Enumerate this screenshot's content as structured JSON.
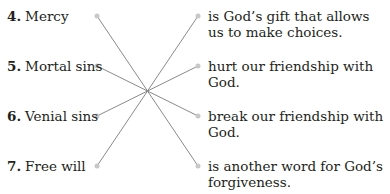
{
  "exercise": {
    "terms": [
      {
        "number": "4.",
        "label": "Mercy"
      },
      {
        "number": "5.",
        "label": "Mortal sins"
      },
      {
        "number": "6.",
        "label": "Venial sins"
      },
      {
        "number": "7.",
        "label": "Free will"
      }
    ],
    "definitions": [
      {
        "label": "is God’s gift that allows us to make choices."
      },
      {
        "label": "hurt our friendship with God."
      },
      {
        "label": "break our friendship with God."
      },
      {
        "label": "is another word for God’s forgiveness."
      }
    ],
    "matches": [
      {
        "term": "Mercy",
        "definition_index": 3
      },
      {
        "term": "Mortal sins",
        "definition_index": 2
      },
      {
        "term": "Venial sins",
        "definition_index": 1
      },
      {
        "term": "Free will",
        "definition_index": 0
      }
    ],
    "line_color": "#8a8a8a",
    "dot_color": "#c8c8c8"
  }
}
